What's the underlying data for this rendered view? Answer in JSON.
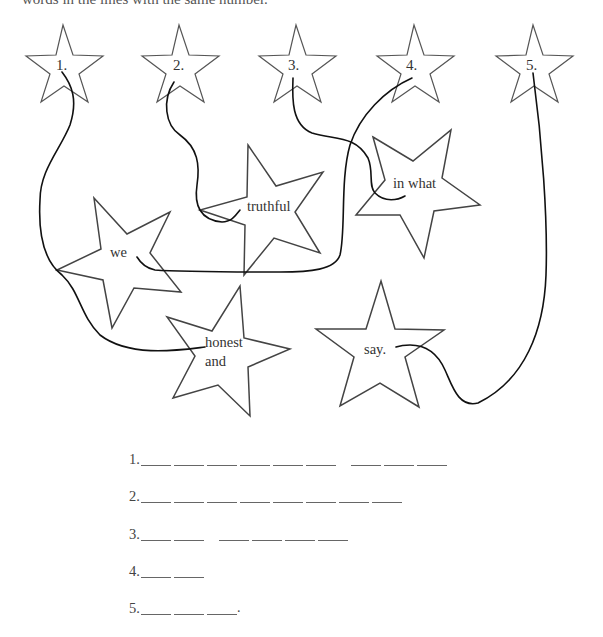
{
  "instruction": "words in the lines with the same number.",
  "number_stars": [
    {
      "label": "1.",
      "cx": 65
    },
    {
      "label": "2.",
      "cx": 180
    },
    {
      "label": "3.",
      "cx": 296
    },
    {
      "label": "4.",
      "cx": 414
    },
    {
      "label": "5.",
      "cx": 533
    }
  ],
  "word_stars": [
    {
      "id": "we",
      "lines": [
        "we"
      ]
    },
    {
      "id": "truthful",
      "lines": [
        "truthful"
      ]
    },
    {
      "id": "in-what",
      "lines": [
        "in what"
      ]
    },
    {
      "id": "honest-and",
      "lines": [
        "honest",
        "and"
      ]
    },
    {
      "id": "say",
      "lines": [
        "say."
      ]
    }
  ],
  "connections": [
    {
      "from": "1.",
      "to": "honest and"
    },
    {
      "from": "2.",
      "to": "truthful"
    },
    {
      "from": "3.",
      "to": "in what"
    },
    {
      "from": "4.",
      "to": "we"
    },
    {
      "from": "5.",
      "to": "say."
    }
  ],
  "answer_rows": [
    {
      "label": "1.",
      "groups": [
        6,
        3
      ],
      "end": ""
    },
    {
      "label": "2.",
      "groups": [
        8
      ],
      "end": ""
    },
    {
      "label": "3.",
      "groups": [
        2,
        4
      ],
      "end": ""
    },
    {
      "label": "4.",
      "groups": [
        2
      ],
      "end": ""
    },
    {
      "label": "5.",
      "groups": [
        3
      ],
      "end": "."
    }
  ]
}
